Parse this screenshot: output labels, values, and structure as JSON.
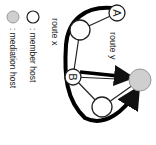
{
  "diagram": {
    "orientation_deg": 90,
    "nodes": [
      {
        "id": "A",
        "label": "A",
        "type": "member",
        "color": "#ffffff"
      },
      {
        "id": "n1",
        "label": "",
        "type": "member",
        "color": "#ffffff"
      },
      {
        "id": "B",
        "label": "B",
        "type": "member",
        "color": "#ffffff"
      },
      {
        "id": "n2",
        "label": "",
        "type": "member",
        "color": "#ffffff"
      },
      {
        "id": "M",
        "label": "",
        "type": "mediation",
        "color": "#cccccc"
      }
    ],
    "edges": [
      [
        "A",
        "n1"
      ],
      [
        "n1",
        "B"
      ],
      [
        "B",
        "n2"
      ],
      [
        "n2",
        "M"
      ],
      [
        "B",
        "M"
      ]
    ],
    "routes": [
      {
        "name": "route x",
        "path": [
          "A",
          "n1",
          "B",
          "n2",
          "M"
        ]
      },
      {
        "name": "route y",
        "path": [
          "B",
          "M"
        ]
      }
    ],
    "labels": {
      "route_x": "route x",
      "route_y": "route y"
    },
    "legend": [
      {
        "symbol": "white-circle",
        "text": ": member host",
        "color": "#ffffff"
      },
      {
        "symbol": "gray-circle",
        "text": ": mediation host",
        "color": "#cccccc"
      }
    ]
  }
}
